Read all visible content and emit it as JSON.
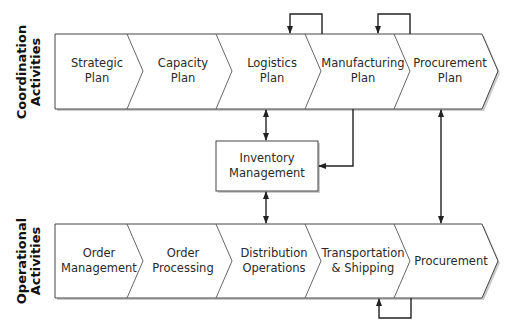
{
  "diagram": {
    "type": "process-flow",
    "rows": [
      {
        "id": "coordination",
        "label_line1": "Coordination",
        "label_line2": "Activities",
        "segments": [
          {
            "id": "strategic-plan",
            "line1": "Strategic",
            "line2": "Plan"
          },
          {
            "id": "capacity-plan",
            "line1": "Capacity",
            "line2": "Plan"
          },
          {
            "id": "logistics-plan",
            "line1": "Logistics",
            "line2": "Plan"
          },
          {
            "id": "manufacturing-plan",
            "line1": "Manufacturing",
            "line2": "Plan"
          },
          {
            "id": "procurement-plan",
            "line1": "Procurement",
            "line2": "Plan"
          }
        ]
      },
      {
        "id": "operational",
        "label_line1": "Operational",
        "label_line2": "Activities",
        "segments": [
          {
            "id": "order-management",
            "line1": "Order",
            "line2": "Management"
          },
          {
            "id": "order-processing",
            "line1": "Order",
            "line2": "Processing"
          },
          {
            "id": "distribution-operations",
            "line1": "Distribution",
            "line2": "Operations"
          },
          {
            "id": "transportation-shipping",
            "line1": "Transportation",
            "line2": "& Shipping"
          },
          {
            "id": "procurement",
            "line1": "Procurement",
            "line2": ""
          }
        ]
      }
    ],
    "center_box": {
      "line1": "Inventory",
      "line2": "Management"
    },
    "connections": [
      {
        "from": "manufacturing-plan",
        "to": "logistics-plan",
        "type": "loop-feedback"
      },
      {
        "from": "procurement-plan",
        "to": "manufacturing-plan",
        "type": "loop-feedback"
      },
      {
        "from": "procurement",
        "to": "transportation-shipping",
        "type": "loop-feedback"
      },
      {
        "from": "logistics-plan",
        "to": "inventory-management",
        "type": "bidirectional"
      },
      {
        "from": "inventory-management",
        "to": "distribution-operations",
        "type": "bidirectional"
      },
      {
        "from": "manufacturing-plan",
        "to": "inventory-management",
        "type": "directed"
      },
      {
        "from": "procurement-plan",
        "to": "procurement",
        "type": "bidirectional"
      }
    ],
    "colors": {
      "stroke": "#333333",
      "fill": "#ffffff",
      "shadow": "#9a9a9a",
      "text": "#2a2a2a"
    }
  }
}
